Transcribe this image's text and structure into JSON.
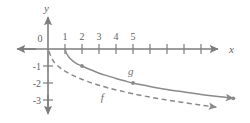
{
  "figure": {
    "width": 250,
    "height": 123,
    "background": "#ffffff",
    "axis_color": "#7d7d7d",
    "curve_color": "#8a8a8a",
    "text_color": "#5f5f5f"
  },
  "labels": {
    "x_axis": "x",
    "y_axis": "y",
    "origin": "0",
    "curve_f": "f",
    "curve_g": "g"
  },
  "chart_data": {
    "type": "line",
    "title": "",
    "xlabel": "x",
    "ylabel": "y",
    "grid": false,
    "legend": "inline-curve-labels",
    "xlim": [
      -1.8,
      11.8
    ],
    "ylim": [
      -3.9,
      1.9
    ],
    "x_ticks": [
      1,
      2,
      3,
      4,
      5,
      6,
      7,
      8,
      9,
      10,
      11
    ],
    "x_tick_labels": [
      "1",
      "2",
      "3",
      "4",
      "5",
      "",
      "",
      "",
      "",
      "",
      ""
    ],
    "y_ticks": [
      -1,
      -2,
      -3
    ],
    "y_tick_labels": [
      "-1",
      "-2",
      "-3"
    ],
    "series": [
      {
        "name": "g",
        "style": "solid",
        "label": "g",
        "label_position": [
          4.7,
          -1.55
        ],
        "arrow_end": true,
        "points": [
          [
            1.0,
            0.0
          ],
          [
            1.1,
            -0.28
          ],
          [
            1.25,
            -0.5
          ],
          [
            1.45,
            -0.7
          ],
          [
            1.7,
            -0.87
          ],
          [
            2.0,
            -1.0
          ],
          [
            2.4,
            -1.18
          ],
          [
            2.9,
            -1.38
          ],
          [
            3.4,
            -1.55
          ],
          [
            4.0,
            -1.73
          ],
          [
            4.5,
            -1.87
          ],
          [
            5.0,
            -2.0
          ],
          [
            6.0,
            -2.2
          ],
          [
            7.0,
            -2.38
          ],
          [
            8.0,
            -2.53
          ],
          [
            9.0,
            -2.67
          ],
          [
            10.0,
            -2.8
          ],
          [
            10.9,
            -2.9
          ]
        ],
        "markers": [
          [
            2.0,
            -1.0
          ],
          [
            5.0,
            -2.0
          ],
          [
            10.9,
            -2.9
          ]
        ]
      },
      {
        "name": "f",
        "style": "dashed",
        "label": "f",
        "label_position": [
          3.1,
          -3.05
        ],
        "arrow_end": true,
        "points": [
          [
            0.05,
            -0.12
          ],
          [
            0.2,
            -0.5
          ],
          [
            0.4,
            -0.82
          ],
          [
            0.7,
            -1.1
          ],
          [
            1.0,
            -1.3
          ],
          [
            1.4,
            -1.52
          ],
          [
            1.8,
            -1.7
          ],
          [
            2.3,
            -1.9
          ],
          [
            2.9,
            -2.1
          ],
          [
            3.5,
            -2.28
          ],
          [
            4.2,
            -2.45
          ],
          [
            5.0,
            -2.63
          ],
          [
            6.0,
            -2.83
          ],
          [
            7.0,
            -3.0
          ],
          [
            8.0,
            -3.15
          ],
          [
            9.0,
            -3.3
          ],
          [
            9.9,
            -3.42
          ]
        ],
        "markers": []
      }
    ]
  }
}
